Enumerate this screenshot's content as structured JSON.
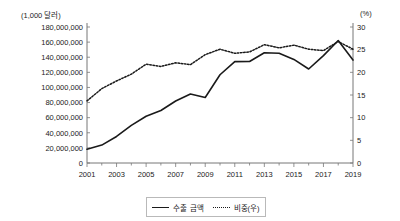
{
  "chart_data": {
    "type": "line",
    "title": "",
    "xlabel": "",
    "ylabel": "(1,000 달러)",
    "y2label": "(%)",
    "grid": false,
    "legend_position": "bottom-center",
    "x": [
      2001,
      2002,
      2003,
      2004,
      2005,
      2006,
      2007,
      2008,
      2009,
      2010,
      2011,
      2012,
      2013,
      2014,
      2015,
      2016,
      2017,
      2018,
      2019
    ],
    "xtick_labels": [
      "2001",
      "2003",
      "2005",
      "2007",
      "2009",
      "2011",
      "2013",
      "2015",
      "2017",
      "2019"
    ],
    "xlim": [
      2001,
      2019
    ],
    "ylim": [
      0,
      180000000
    ],
    "ytick_labels": [
      "0",
      "20,000,000",
      "40,000,000",
      "60,000,000",
      "80,000,000",
      "100,000,000",
      "120,000,000",
      "140,000,000",
      "160,000,000",
      "180,000,000"
    ],
    "ytick_values": [
      0,
      20000000,
      40000000,
      60000000,
      80000000,
      100000000,
      120000000,
      140000000,
      160000000,
      180000000
    ],
    "y2lim": [
      0,
      30
    ],
    "y2tick_labels": [
      "0",
      "5",
      "10",
      "15",
      "20",
      "25",
      "30"
    ],
    "y2tick_values": [
      0,
      5,
      10,
      15,
      20,
      25,
      30
    ],
    "series": [
      {
        "name": "수출 금액",
        "axis": "left",
        "style": "solid",
        "color": "#1a1a1a",
        "values": [
          18200000,
          23700000,
          35100000,
          49800000,
          61900000,
          69500000,
          82000000,
          91400000,
          86700000,
          116800000,
          134200000,
          134300000,
          145900000,
          145300000,
          137100000,
          124400000,
          142100000,
          162100000,
          136200000
        ]
      },
      {
        "name": "비중(우)",
        "axis": "right",
        "style": "dotted",
        "color": "#1a1a1a",
        "values": [
          13.7,
          16.4,
          18.1,
          19.6,
          21.8,
          21.3,
          22.1,
          21.7,
          23.9,
          25.1,
          24.2,
          24.5,
          26.1,
          25.4,
          26.0,
          25.1,
          24.8,
          26.8,
          25.1
        ]
      }
    ]
  },
  "legend": {
    "items": [
      {
        "label": "수출 금액",
        "style": "solid"
      },
      {
        "label": "비중(우)",
        "style": "dotted"
      }
    ]
  }
}
